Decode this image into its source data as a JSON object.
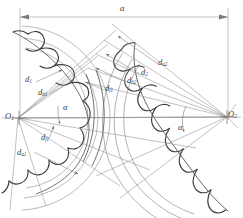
{
  "figure": {
    "background_color": "#ffffff",
    "line_color": "#4a4a4a",
    "thin_line_color": "#8d8d8d",
    "profile_color": "#3c3c3c"
  },
  "dimension": {
    "center_distance_label": "a",
    "x_start": 20,
    "x_end": 228,
    "y": 17
  },
  "centers": {
    "o1": {
      "label": "O",
      "sub": "1",
      "x": 18,
      "y": 118
    },
    "o2": {
      "label": "O",
      "sub": "2",
      "x": 227,
      "y": 117
    }
  },
  "angles": [
    {
      "name": "alpha-left",
      "label": "α",
      "x": 63,
      "y": 108
    },
    {
      "name": "alpha-right",
      "label": "α",
      "x": 178,
      "y": 128
    }
  ],
  "callouts": [
    {
      "name": "d1",
      "base": "d",
      "sub": "1",
      "x": 24,
      "y": 84,
      "tip_x": 62,
      "tip_y": 70
    },
    {
      "name": "db1",
      "base": "d",
      "sub": "b1",
      "x": 36,
      "y": 96,
      "tip_x": 72,
      "tip_y": 78
    },
    {
      "name": "df1-left",
      "base": "d",
      "sub": "f1",
      "x": 40,
      "y": 142,
      "tip_x": 48,
      "tip_y": 126
    },
    {
      "name": "da1",
      "base": "d",
      "sub": "a1",
      "x": 16,
      "y": 156,
      "tip_x": 76,
      "tip_y": 176
    },
    {
      "name": "da2",
      "base": "d",
      "sub": "a2",
      "x": 158,
      "y": 66,
      "tip_x": 116,
      "tip_y": 36
    },
    {
      "name": "d2",
      "base": "d",
      "sub": "2",
      "x": 140,
      "y": 76,
      "tip_x": 106,
      "tip_y": 56
    },
    {
      "name": "db2",
      "base": "d",
      "sub": "b2",
      "x": 126,
      "y": 84,
      "tip_x": 98,
      "tip_y": 70
    },
    {
      "name": "df2",
      "base": "d",
      "sub": "f1",
      "x": 104,
      "y": 92,
      "tip_x": 88,
      "tip_y": 84
    }
  ],
  "gears": {
    "left": {
      "name": "left-gear",
      "center_x": 18,
      "center_y": 118,
      "tip_radius": 92,
      "ref_radius": 80,
      "root_radius": 70,
      "teeth": 18
    },
    "right": {
      "name": "right-gear",
      "center_x": 227,
      "center_y": 117,
      "tip_radius": 126,
      "ref_radius": 114,
      "root_radius": 104,
      "teeth": 24,
      "tilt_deg": 20
    }
  }
}
